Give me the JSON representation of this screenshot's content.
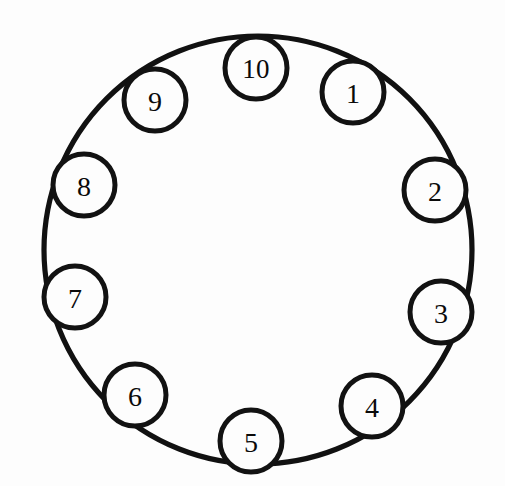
{
  "figure": {
    "name": "numbered-ring-diagram",
    "background_color": "#fdfdfd",
    "stroke_color": "#111111",
    "node_fill_color": "#fdfdfd",
    "node_stroke_color": "#121212"
  },
  "ring": {
    "center_x": 258,
    "center_y": 250,
    "radius": 214,
    "stroke_width": 5.2
  },
  "node_defaults": {
    "radius": 31,
    "stroke_width": 5.0
  },
  "nodes": [
    {
      "label": "1",
      "cx": 353,
      "cy": 92
    },
    {
      "label": "2",
      "cx": 435,
      "cy": 190
    },
    {
      "label": "3",
      "cx": 441,
      "cy": 312
    },
    {
      "label": "4",
      "cx": 372,
      "cy": 406
    },
    {
      "label": "5",
      "cx": 251,
      "cy": 441
    },
    {
      "label": "6",
      "cx": 135,
      "cy": 395
    },
    {
      "label": "7",
      "cx": 75,
      "cy": 297
    },
    {
      "label": "8",
      "cx": 84,
      "cy": 185
    },
    {
      "label": "9",
      "cx": 155,
      "cy": 100
    },
    {
      "label": "10",
      "cx": 256,
      "cy": 68
    }
  ]
}
